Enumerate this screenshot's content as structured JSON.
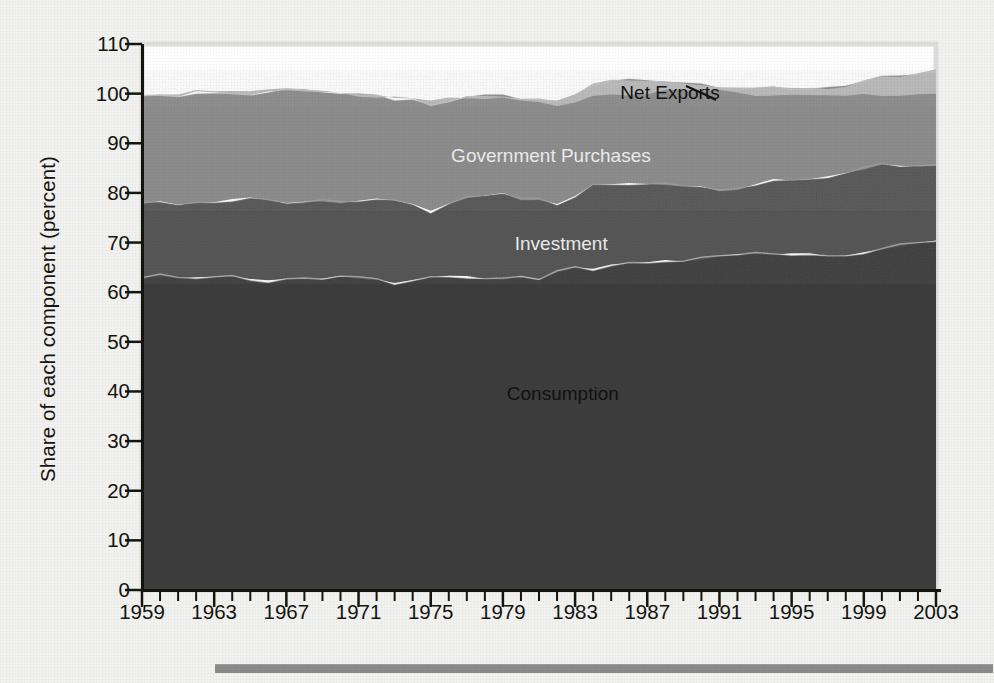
{
  "figure": {
    "y_axis_title": "Share of each component (percent)",
    "plot_frame_color": "#d8d8d4",
    "axis_color": "#15150f",
    "background_color": "#f2f2f0"
  },
  "chart_data": {
    "type": "area",
    "stacked": true,
    "title": "",
    "xlabel": "",
    "ylabel": "Share of each component (percent)",
    "xlim": [
      1959,
      2003
    ],
    "ylim": [
      0,
      110
    ],
    "ytick_values": [
      0,
      10,
      20,
      30,
      40,
      50,
      60,
      70,
      80,
      90,
      100,
      110
    ],
    "ytick_labels": [
      "0",
      "10",
      "20",
      "30",
      "40",
      "50",
      "60",
      "70",
      "80",
      "90",
      "100",
      "110"
    ],
    "xtick_labels": [
      "1959",
      "1963",
      "1967",
      "1971",
      "1975",
      "1979",
      "1983",
      "1987",
      "1991",
      "1995",
      "1999",
      "2003"
    ],
    "xtick_values": [
      1959,
      1963,
      1967,
      1971,
      1975,
      1979,
      1983,
      1987,
      1991,
      1995,
      1999,
      2003
    ],
    "minor_xtick_interval": 1,
    "grid": false,
    "legend": "in-plot labels",
    "x": [
      1959,
      1960,
      1961,
      1962,
      1963,
      1964,
      1965,
      1966,
      1967,
      1968,
      1969,
      1970,
      1971,
      1972,
      1973,
      1974,
      1975,
      1976,
      1977,
      1978,
      1979,
      1980,
      1981,
      1982,
      1983,
      1984,
      1985,
      1986,
      1987,
      1988,
      1989,
      1990,
      1991,
      1992,
      1993,
      1994,
      1995,
      1996,
      1997,
      1998,
      1999,
      2000,
      2001,
      2002,
      2003
    ],
    "series": [
      {
        "name": "Consumption",
        "color": "#3c3c3c",
        "label_color": "#111111",
        "values": [
          62.9,
          63.4,
          62.9,
          62.8,
          62.9,
          63.2,
          62.6,
          62.2,
          62.7,
          62.9,
          62.8,
          63.2,
          62.8,
          62.6,
          61.6,
          62.2,
          63.0,
          63.3,
          63.1,
          62.7,
          62.8,
          63.3,
          62.5,
          64.0,
          65.0,
          64.5,
          65.3,
          65.9,
          66.1,
          66.4,
          66.2,
          66.9,
          67.4,
          67.5,
          67.7,
          67.6,
          67.6,
          67.6,
          67.3,
          67.5,
          68.0,
          68.7,
          69.5,
          70.0,
          70.2
        ]
      },
      {
        "name": "Investment",
        "color": "#565656",
        "label_color": "#ececec",
        "values": [
          15.1,
          14.8,
          14.5,
          15.1,
          15.2,
          15.3,
          16.4,
          16.5,
          15.4,
          15.3,
          15.6,
          14.9,
          15.5,
          16.0,
          16.8,
          15.6,
          13.2,
          14.5,
          16.1,
          16.9,
          17.1,
          15.3,
          16.2,
          13.6,
          14.1,
          17.1,
          16.5,
          16.0,
          15.7,
          15.5,
          15.3,
          14.3,
          12.9,
          13.2,
          13.9,
          14.9,
          14.9,
          15.3,
          16.0,
          16.5,
          17.0,
          17.2,
          15.8,
          15.2,
          15.3
        ]
      },
      {
        "name": "Government Purchases",
        "color": "#8c8c8c",
        "label_color": "#ececec",
        "values": [
          21.4,
          21.3,
          21.9,
          22.3,
          22.0,
          21.5,
          20.9,
          21.7,
          22.7,
          22.5,
          21.9,
          21.8,
          21.5,
          21.2,
          20.5,
          21.1,
          21.5,
          20.7,
          20.3,
          20.0,
          19.7,
          20.3,
          20.0,
          20.8,
          20.8,
          20.3,
          20.9,
          21.0,
          21.0,
          20.6,
          20.5,
          20.6,
          20.9,
          20.2,
          19.5,
          19.0,
          18.6,
          18.2,
          17.9,
          17.6,
          17.6,
          17.5,
          18.1,
          18.8,
          19.1
        ]
      },
      {
        "name": "Net Exports",
        "color": "#b9b9b9",
        "label_color": "#111111",
        "values": [
          0.2,
          0.5,
          0.6,
          0.5,
          0.6,
          0.8,
          0.5,
          0.3,
          0.3,
          0.1,
          0.0,
          0.2,
          -0.2,
          -0.5,
          0.5,
          0.3,
          1.1,
          0.6,
          -0.7,
          -0.7,
          -0.4,
          -0.5,
          -0.4,
          -0.6,
          -1.5,
          -2.4,
          -2.8,
          -3.1,
          -3.1,
          -2.0,
          -1.3,
          -1.3,
          -0.6,
          -0.7,
          -1.3,
          -1.7,
          -1.4,
          -1.4,
          -1.4,
          -2.2,
          -3.0,
          -3.9,
          -3.7,
          -4.2,
          -4.6
        ]
      }
    ],
    "annotations": [
      {
        "text": "Net Exports",
        "x_frac": 0.665,
        "y_frac": 0.088,
        "style": "dark",
        "leader": true
      },
      {
        "text": "Government Purchases",
        "x_frac": 0.515,
        "y_frac": 0.203,
        "style": "light",
        "leader": false
      },
      {
        "text": "Investment",
        "x_frac": 0.528,
        "y_frac": 0.365,
        "style": "light",
        "leader": false
      },
      {
        "text": "Consumption",
        "x_frac": 0.53,
        "y_frac": 0.64,
        "style": "dark",
        "leader": false
      }
    ]
  }
}
